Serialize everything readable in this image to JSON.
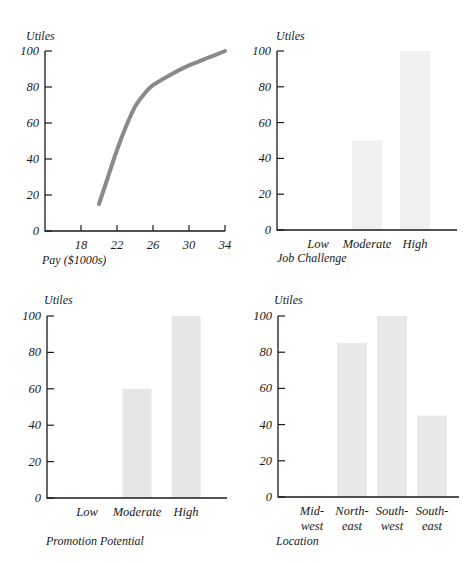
{
  "chart_data": [
    {
      "id": "pay",
      "type": "line",
      "title": "",
      "ylabel": "Utiles",
      "xlabel": "Pay ($1000s)",
      "ylim": [
        0,
        100
      ],
      "xlim": [
        14,
        34
      ],
      "yticks": [
        0,
        20,
        40,
        60,
        80,
        100
      ],
      "xticks": [
        18,
        22,
        26,
        30,
        34
      ],
      "grid": false,
      "line_color": "#8a8a8a",
      "x": [
        20,
        21,
        22,
        23,
        24,
        25,
        26,
        28,
        30,
        32,
        34
      ],
      "y": [
        15,
        30,
        45,
        58,
        69,
        76,
        81,
        87,
        92,
        96,
        100
      ]
    },
    {
      "id": "job",
      "type": "bar",
      "title": "",
      "ylabel": "Utiles",
      "xlabel": "Job Challenge",
      "ylim": [
        0,
        100
      ],
      "yticks": [
        0,
        20,
        40,
        60,
        80,
        100
      ],
      "grid": false,
      "bar_color": "#f0f0f0",
      "categories": [
        "Low",
        "Moderate",
        "High"
      ],
      "values": [
        0,
        50,
        100
      ]
    },
    {
      "id": "promotion",
      "type": "bar",
      "title": "",
      "ylabel": "Utiles",
      "xlabel": "Promotion Potential",
      "ylim": [
        0,
        100
      ],
      "yticks": [
        0,
        20,
        40,
        60,
        80,
        100
      ],
      "grid": false,
      "bar_color": "#e6e6e6",
      "categories": [
        "Low",
        "Moderate",
        "High"
      ],
      "values": [
        0,
        60,
        100
      ]
    },
    {
      "id": "location",
      "type": "bar",
      "title": "",
      "ylabel": "Utiles",
      "xlabel": "Location",
      "ylim": [
        0,
        100
      ],
      "yticks": [
        0,
        20,
        40,
        60,
        80,
        100
      ],
      "grid": false,
      "bar_color": "#e8e8e8",
      "categories": [
        "Mid-west",
        "North-east",
        "South-west",
        "South-east"
      ],
      "category_lines": [
        [
          "Mid-",
          "west"
        ],
        [
          "North-",
          "east"
        ],
        [
          "South-",
          "west"
        ],
        [
          "South-",
          "east"
        ]
      ],
      "values": [
        0,
        85,
        100,
        45
      ]
    }
  ]
}
